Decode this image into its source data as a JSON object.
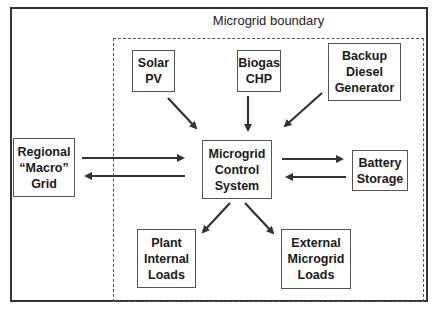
{
  "diagram": {
    "boundary_label": "Microgrid boundary",
    "nodes": {
      "solar": "Solar\nPV",
      "biogas": "Biogas\nCHP",
      "diesel": "Backup\nDiesel\nGenerator",
      "grid": "Regional\n“Macro”\nGrid",
      "control": "Microgrid\nControl\nSystem",
      "battery": "Battery\nStorage",
      "plant": "Plant\nInternal\nLoads",
      "external": "External\nMicrogrid\nLoads"
    },
    "edges": [
      {
        "from": "solar",
        "to": "control"
      },
      {
        "from": "biogas",
        "to": "control"
      },
      {
        "from": "diesel",
        "to": "control"
      },
      {
        "from": "grid",
        "to": "control"
      },
      {
        "from": "control",
        "to": "grid"
      },
      {
        "from": "control",
        "to": "battery"
      },
      {
        "from": "battery",
        "to": "control"
      },
      {
        "from": "control",
        "to": "plant"
      },
      {
        "from": "control",
        "to": "external"
      }
    ],
    "colors": {
      "line": "#333333",
      "box_border": "#555555",
      "background": "#ffffff"
    }
  }
}
